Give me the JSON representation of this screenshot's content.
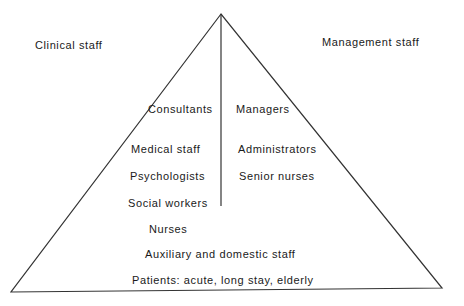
{
  "diagram": {
    "type": "pyramid",
    "line_color": "#333333",
    "groups": {
      "left": "Clinical staff",
      "right": "Management staff"
    },
    "clinical_levels": [
      "Consultants",
      "Medical staff",
      "Psychologists",
      "Social workers"
    ],
    "management_levels": [
      "Managers",
      "Administrators",
      "Senior nurses"
    ],
    "shared_levels": [
      "Nurses",
      "Auxiliary and domestic staff",
      "Patients: acute, long stay, elderly"
    ]
  }
}
